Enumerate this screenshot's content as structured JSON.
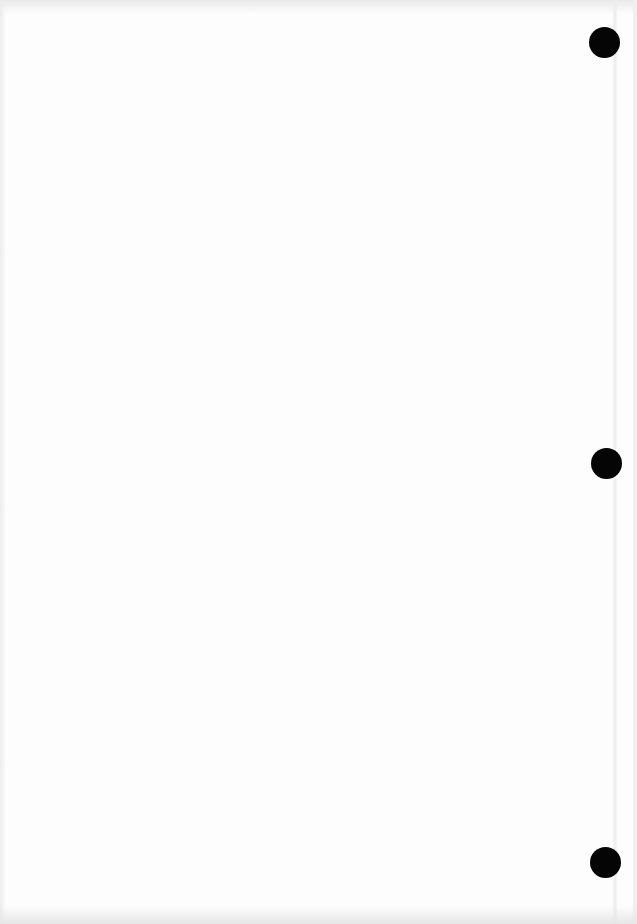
{
  "document": {
    "type": "blank scanned page",
    "background_color": "#fdfdfd",
    "text_content": "",
    "punch_holes": [
      {
        "name": "top",
        "cx": 604,
        "cy": 42,
        "diameter": 31,
        "color": "#050505"
      },
      {
        "name": "middle",
        "cx": 606,
        "cy": 463,
        "diameter": 31,
        "color": "#050505"
      },
      {
        "name": "bottom",
        "cx": 605,
        "cy": 862,
        "diameter": 31,
        "color": "#050505"
      }
    ]
  }
}
